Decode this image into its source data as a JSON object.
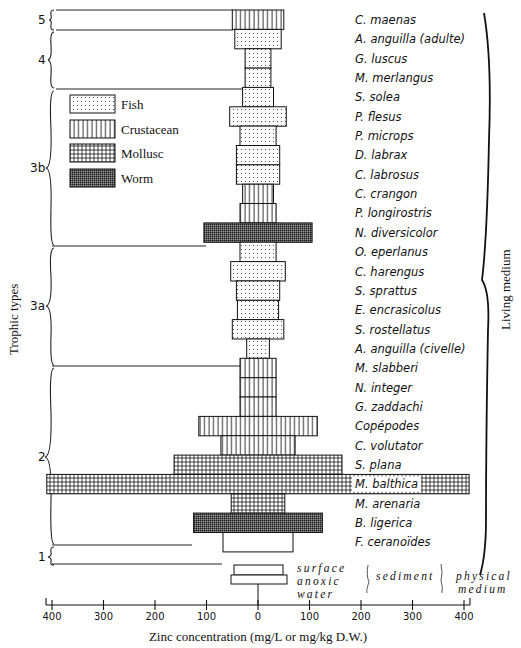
{
  "chart_data": {
    "type": "bar",
    "subtype": "horizontal symmetric (tornado/kite) bar chart",
    "xlabel": "Zinc concentration (mg/L or mg/kg D.W.)",
    "ylabel": "Trophic types",
    "right_label": "Living medium",
    "x_ticks_left": [
      400,
      300,
      200,
      100,
      0
    ],
    "x_ticks_right": [
      100,
      200,
      300,
      400
    ],
    "xlim": [
      -400,
      400
    ],
    "legend": [
      {
        "name": "Fish",
        "pattern": "dots"
      },
      {
        "name": "Crustacean",
        "pattern": "vertical-lines"
      },
      {
        "name": "Mollusc",
        "pattern": "grid"
      },
      {
        "name": "Worm",
        "pattern": "dense-crosshatch"
      }
    ],
    "legend_position": "upper-left",
    "trophic_groups": [
      {
        "label": "5",
        "species": [
          "C. maenas"
        ]
      },
      {
        "label": "4",
        "species": [
          "A. anguilla (adulte)",
          "G. luscus",
          "M. merlangus"
        ]
      },
      {
        "label": "3b",
        "species": [
          "S. solea",
          "P. flesus",
          "P. microps",
          "D. labrax",
          "C. labrosus",
          "C. crangon",
          "P. longirostris",
          "N. diversicolor"
        ]
      },
      {
        "label": "3a",
        "species": [
          "O. eperlanus",
          "C. harengus",
          "S. sprattus",
          "E. encrasicolus",
          "S. rostellatus",
          "A. anguilla (civelle)"
        ]
      },
      {
        "label": "2",
        "species": [
          "M. slabberi",
          "N. integer",
          "G. zaddachi",
          "Copépodes",
          "C. volutator",
          "S. plana",
          "M. balthica",
          "M. arenaria",
          "B. ligerica"
        ]
      },
      {
        "label": "1",
        "species": [
          "F. ceranoïdes"
        ]
      }
    ],
    "categories": [
      "C. maenas",
      "A. anguilla (adulte)",
      "G. luscus",
      "M. merlangus",
      "S. solea",
      "P. flesus",
      "P. microps",
      "D. labrax",
      "C. labrosus",
      "C. crangon",
      "P. longirostris",
      "N. diversicolor",
      "O. eperlanus",
      "C. harengus",
      "S. sprattus",
      "E. encrasicolus",
      "S. rostellatus",
      "A. anguilla (civelle)",
      "M. slabberi",
      "N. integer",
      "G. zaddachi",
      "Copépodes",
      "C. volutator",
      "S. plana",
      "M. balthica",
      "M. arenaria",
      "B. ligerica",
      "F. ceranoïdes"
    ],
    "groups": [
      "Crustacean",
      "Fish",
      "Fish",
      "Fish",
      "Fish",
      "Fish",
      "Fish",
      "Fish",
      "Fish",
      "Crustacean",
      "Crustacean",
      "Worm",
      "Fish",
      "Fish",
      "Fish",
      "Fish",
      "Fish",
      "Fish",
      "Crustacean",
      "Crustacean",
      "Crustacean",
      "Crustacean",
      "Crustacean",
      "Mollusc",
      "Mollusc",
      "Mollusc",
      "Worm",
      "Plant"
    ],
    "values": [
      50,
      45,
      25,
      25,
      30,
      55,
      35,
      42,
      42,
      30,
      35,
      105,
      35,
      53,
      42,
      40,
      50,
      22,
      35,
      35,
      35,
      115,
      72,
      163,
      410,
      52,
      125,
      68
    ],
    "physical_medium": [
      {
        "name": "surface",
        "value": 47
      },
      {
        "name": "anoxic",
        "value": 55
      },
      {
        "name": "water",
        "value": 0
      }
    ],
    "physical_labels": {
      "left": [
        "surface",
        "anoxic",
        "water"
      ],
      "middle": "sediment",
      "right": [
        "physical",
        "medium"
      ]
    },
    "grid": false
  }
}
